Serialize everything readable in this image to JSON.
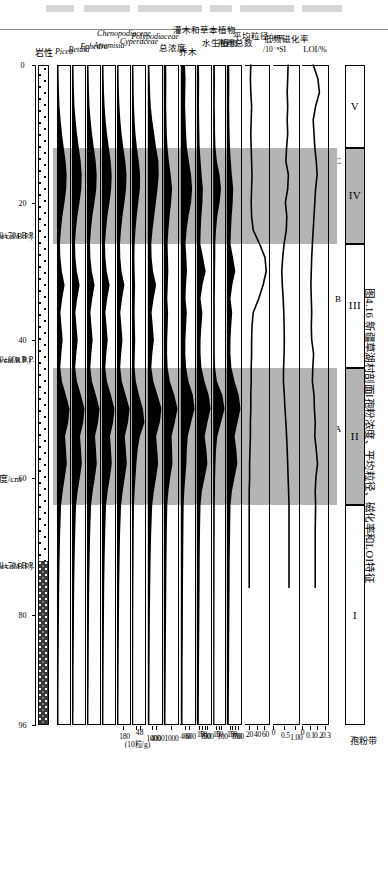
{
  "figure": {
    "caption": "图4.16  新疆草湖村剖面I孢粉浓度、平均粒径、磁化率和LOI特征",
    "depth_axis_label": "深度/cm",
    "lithology_label": "岩性",
    "concentration_unit": "(10粒/g)"
  },
  "zones": {
    "header_label": "孢粉带",
    "items": [
      {
        "name": "V",
        "shaded": false,
        "start_cm": 0,
        "end_cm": 12
      },
      {
        "name": "IV",
        "shaded": true,
        "start_cm": 12,
        "end_cm": 26
      },
      {
        "name": "III",
        "shaded": false,
        "start_cm": 26,
        "end_cm": 44
      },
      {
        "name": "II",
        "shaded": true,
        "start_cm": 44,
        "end_cm": 64
      },
      {
        "name": "I",
        "shaded": false,
        "start_cm": 64,
        "end_cm": 96
      }
    ],
    "subzones": [
      {
        "name": "C",
        "center_cm": 14
      },
      {
        "name": "B",
        "center_cm": 34
      },
      {
        "name": "A",
        "center_cm": 53
      }
    ]
  },
  "depth": {
    "unit": "cm",
    "min": 0,
    "max": 96,
    "ticks": [
      0,
      20,
      40,
      60,
      80,
      96
    ]
  },
  "dates": [
    {
      "uncal": "1210±70a B.P.",
      "cal": "(1140±100a cal.B.P.)",
      "depth_cm": 25
    },
    {
      "uncal": "1420±60a B.P.",
      "cal": "(1310±30a cal.B.P.)",
      "depth_cm": 43
    },
    {
      "uncal": "2890±70a B.P.",
      "cal": "(3000±135a cal.B.P.)",
      "depth_cm": 73
    }
  ],
  "lithology": {
    "segments": [
      {
        "pattern": "sandy-dotted",
        "start_cm": 0,
        "end_cm": 72
      },
      {
        "pattern": "dark-silt",
        "start_cm": 72,
        "end_cm": 96
      }
    ]
  },
  "chart_data": {
    "type": "area",
    "title": "新疆草湖村剖面I孢粉浓度、平均粒径、磁化率和LOI特征",
    "xlabel": "深度/cm",
    "x": [
      0,
      2,
      4,
      6,
      8,
      10,
      12,
      14,
      16,
      18,
      20,
      22,
      24,
      26,
      28,
      30,
      32,
      34,
      36,
      38,
      40,
      42,
      44,
      46,
      48,
      50,
      52,
      54,
      56,
      58,
      60,
      62,
      64,
      68,
      72,
      76,
      80,
      84,
      88,
      92,
      96
    ],
    "panels": [
      {
        "name": "LOI",
        "label": "LOI/%",
        "render": "line",
        "ticks": [
          0,
          0.1,
          0.2,
          0.3
        ],
        "tick_labels": [
          "0",
          "0.1",
          "0.2",
          "0.3"
        ],
        "xlim": [
          0,
          0.32
        ],
        "values": [
          0.13,
          0.19,
          0.21,
          0.16,
          0.13,
          0.14,
          0.15,
          0.17,
          0.18,
          0.16,
          0.15,
          0.14,
          0.13,
          0.12,
          0.11,
          0.105,
          0.1,
          0.105,
          0.11,
          0.105,
          0.11,
          0.135,
          0.125,
          0.12,
          0.14,
          0.145,
          0.155,
          0.15,
          0.17,
          0.185,
          0.165,
          0.155,
          0.16,
          0.155,
          0.155,
          0.155,
          null,
          null,
          null,
          null,
          null
        ]
      },
      {
        "name": "magnetic_susceptibility",
        "label": "低频磁化率",
        "sublabel": "/10⁻⁸SI",
        "render": "line",
        "ticks": [
          0,
          0.5,
          1.0
        ],
        "tick_labels": [
          "0",
          "0.5",
          "1.00"
        ],
        "xlim": [
          0,
          1.1
        ],
        "values": [
          0.62,
          0.6,
          0.58,
          0.6,
          0.58,
          0.6,
          0.55,
          0.52,
          0.63,
          0.6,
          0.5,
          0.56,
          0.54,
          0.44,
          0.38,
          0.34,
          0.36,
          0.4,
          0.43,
          0.44,
          0.45,
          0.44,
          0.42,
          0.41,
          0.45,
          0.48,
          0.52,
          0.55,
          0.58,
          0.6,
          0.62,
          0.64,
          0.66,
          0.66,
          0.66,
          0.66,
          null,
          null,
          null,
          null,
          null
        ]
      },
      {
        "name": "mean_grain_size",
        "label": "平均粒径/μm",
        "render": "line",
        "ticks": [
          20,
          40,
          60
        ],
        "tick_labels": [
          "20",
          "40",
          "60"
        ],
        "xlim": [
          10,
          70
        ],
        "values": [
          24,
          23,
          24,
          26,
          25,
          24,
          25,
          26,
          27,
          26,
          25,
          26,
          30,
          46,
          60,
          63,
          55,
          44,
          30,
          27,
          26,
          26,
          25,
          25,
          24,
          24,
          23,
          23,
          22,
          21,
          21,
          20,
          20,
          20,
          20,
          20,
          null,
          null,
          null,
          null,
          null
        ]
      },
      {
        "name": "pollen_total",
        "label": "孢粉总数",
        "render": "area",
        "ticks": [
          10,
          50,
          100,
          700
        ],
        "tick_labels": [
          "10",
          "50",
          "100",
          "700"
        ],
        "values": [
          60,
          70,
          65,
          60,
          70,
          80,
          95,
          130,
          180,
          240,
          215,
          170,
          140,
          120,
          230,
          330,
          200,
          120,
          195,
          150,
          120,
          115,
          160,
          300,
          480,
          560,
          430,
          300,
          380,
          420,
          300,
          180,
          120,
          100,
          85,
          80,
          70,
          60,
          55,
          50,
          45
        ]
      },
      {
        "name": "aquatic_plants",
        "label": "水生植物",
        "render": "area",
        "ticks": [
          10,
          50,
          100
        ],
        "tick_labels": [
          "10",
          "50",
          "100"
        ],
        "values": [
          15,
          18,
          16,
          14,
          18,
          22,
          30,
          60,
          120,
          150,
          120,
          70,
          40,
          25,
          25,
          20,
          18,
          15,
          16,
          15,
          14,
          14,
          20,
          60,
          180,
          230,
          150,
          70,
          40,
          30,
          22,
          18,
          14,
          12,
          10,
          9,
          8,
          7,
          6,
          6,
          5
        ]
      },
      {
        "name": "shrub_herb",
        "label": "灌木和草本植物",
        "render": "area",
        "ticks": [
          10,
          50,
          100,
          500
        ],
        "tick_labels": [
          "10",
          "50",
          "100",
          "500"
        ],
        "values": [
          45,
          55,
          52,
          48,
          55,
          62,
          75,
          110,
          150,
          200,
          180,
          140,
          115,
          100,
          210,
          310,
          185,
          105,
          180,
          140,
          110,
          105,
          140,
          265,
          430,
          500,
          380,
          270,
          340,
          380,
          270,
          160,
          105,
          88,
          75,
          70,
          62,
          55,
          48,
          44,
          40
        ]
      },
      {
        "name": "arbor",
        "label": "乔木",
        "render": "area",
        "ticks": [
          400,
          600
        ],
        "tick_labels": [
          "400",
          "600"
        ],
        "values": [
          160,
          190,
          175,
          165,
          190,
          215,
          255,
          360,
          470,
          520,
          470,
          340,
          240,
          185,
          230,
          260,
          210,
          185,
          250,
          215,
          180,
          175,
          215,
          340,
          560,
          640,
          470,
          300,
          250,
          230,
          175,
          125,
          95,
          80,
          70,
          62,
          55,
          48,
          42,
          38,
          34
        ]
      },
      {
        "name": "total_concentration",
        "label": "总浓度",
        "render": "area",
        "ticks": [
          1000
        ],
        "tick_labels": [
          "1000"
        ],
        "values": [
          30,
          35,
          33,
          30,
          38,
          45,
          60,
          90,
          130,
          160,
          140,
          105,
          80,
          62,
          70,
          78,
          65,
          56,
          72,
          63,
          52,
          50,
          62,
          110,
          210,
          280,
          220,
          150,
          160,
          170,
          120,
          80,
          55,
          45,
          38,
          33,
          28,
          24,
          21,
          18,
          16
        ]
      },
      {
        "name": "polypodiaceae",
        "label": "Polypodiaceae",
        "render": "area",
        "ticks": [
          1000,
          4000
        ],
        "tick_labels": [
          "1000",
          "4000"
        ],
        "values": [
          40,
          60,
          90,
          140,
          240,
          380,
          520,
          680,
          700,
          620,
          500,
          380,
          260,
          180,
          200,
          300,
          520,
          340,
          200,
          280,
          360,
          250,
          180,
          320,
          620,
          900,
          780,
          520,
          600,
          660,
          520,
          360,
          240,
          170,
          130,
          100,
          80,
          65,
          55,
          46,
          40
        ]
      },
      {
        "name": "cyperaceae",
        "label": "Cyperaceae",
        "render": "area",
        "ticks": [
          4,
          8
        ],
        "tick_labels": [
          "4",
          "8"
        ],
        "values": [
          20,
          25,
          30,
          45,
          70,
          110,
          170,
          250,
          310,
          300,
          230,
          160,
          110,
          70,
          60,
          70,
          90,
          80,
          70,
          85,
          95,
          80,
          70,
          120,
          260,
          430,
          500,
          300,
          200,
          150,
          110,
          70,
          45,
          32,
          25,
          20,
          16,
          13,
          11,
          9,
          8
        ]
      },
      {
        "name": "chenopodiaceae",
        "label": "Chenopodiaceae",
        "render": "area",
        "ticks": [
          180
        ],
        "tick_labels": [
          "180"
        ],
        "values": [
          25,
          32,
          45,
          70,
          110,
          170,
          250,
          340,
          400,
          380,
          300,
          210,
          140,
          95,
          110,
          165,
          300,
          190,
          110,
          160,
          210,
          150,
          105,
          180,
          360,
          540,
          470,
          320,
          370,
          410,
          320,
          220,
          145,
          100,
          75,
          58,
          46,
          37,
          31,
          26,
          22
        ]
      },
      {
        "name": "artemisia",
        "label": "Artemisia",
        "render": "area",
        "ticks": [],
        "tick_labels": [],
        "values": [
          30,
          40,
          58,
          90,
          150,
          230,
          330,
          440,
          500,
          470,
          370,
          255,
          170,
          115,
          140,
          215,
          380,
          240,
          140,
          205,
          270,
          190,
          130,
          225,
          450,
          660,
          580,
          400,
          460,
          505,
          395,
          270,
          180,
          125,
          92,
          72,
          57,
          46,
          38,
          32,
          27
        ]
      },
      {
        "name": "ephedra",
        "label": "Ephedra",
        "render": "area",
        "ticks": [],
        "tick_labels": [],
        "values": [
          18,
          24,
          34,
          52,
          88,
          135,
          195,
          260,
          295,
          280,
          220,
          150,
          100,
          68,
          82,
          128,
          225,
          142,
          82,
          120,
          160,
          112,
          77,
          133,
          266,
          390,
          343,
          236,
          272,
          298,
          233,
          160,
          106,
          74,
          55,
          42,
          34,
          27,
          23,
          19,
          16
        ]
      },
      {
        "name": "betula",
        "label": "Betula",
        "render": "area",
        "ticks": [],
        "tick_labels": [],
        "values": [
          14,
          18,
          26,
          40,
          68,
          104,
          150,
          200,
          227,
          215,
          169,
          115,
          77,
          52,
          63,
          98,
          173,
          109,
          63,
          92,
          123,
          86,
          59,
          102,
          205,
          300,
          264,
          182,
          209,
          229,
          179,
          123,
          81,
          57,
          42,
          32,
          26,
          21,
          17,
          15,
          12
        ]
      },
      {
        "name": "picea",
        "label": "Picea",
        "render": "area",
        "ticks": [],
        "tick_labels": [],
        "values": [
          10,
          13,
          19,
          29,
          49,
          75,
          108,
          144,
          164,
          155,
          122,
          83,
          55,
          38,
          45,
          71,
          125,
          79,
          45,
          66,
          89,
          62,
          43,
          74,
          148,
          217,
          191,
          131,
          151,
          165,
          129,
          89,
          59,
          41,
          30,
          23,
          19,
          15,
          12,
          10,
          9
        ]
      }
    ]
  }
}
